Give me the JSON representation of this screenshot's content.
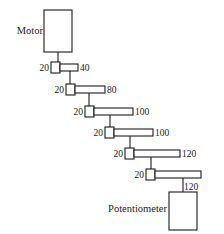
{
  "diagram": {
    "type": "gear-train-schematic",
    "stroke_color": "#1a1a1a",
    "fill_color": "#ffffff",
    "background_color": "#ffffff",
    "motor": {
      "label": "Motor",
      "label_x": 43,
      "label_y": 34,
      "box": {
        "x": 44,
        "y": 10,
        "w": 28,
        "h": 42
      }
    },
    "potentiometer": {
      "label": "Potentiometer",
      "label_x": 167,
      "label_y": 212,
      "box": {
        "x": 169,
        "y": 192,
        "w": 28,
        "h": 38
      }
    },
    "stages": [
      {
        "name": "stage-1",
        "pinion_teeth": "20",
        "gear_teeth": "40",
        "pinion": {
          "x": 51,
          "y": 62,
          "w": 9,
          "h": 11
        },
        "gear": {
          "x": 60,
          "y": 64,
          "w": 18,
          "h": 7
        },
        "pinion_label_x": 49,
        "pinion_label_y": 71,
        "gear_label_x": 80,
        "gear_label_y": 71
      },
      {
        "name": "stage-2",
        "pinion_teeth": "20",
        "gear_teeth": "80",
        "pinion": {
          "x": 66,
          "y": 84,
          "w": 9,
          "h": 11
        },
        "gear": {
          "x": 75,
          "y": 86,
          "w": 30,
          "h": 7
        },
        "pinion_label_x": 64,
        "pinion_label_y": 93,
        "gear_label_x": 107,
        "gear_label_y": 93
      },
      {
        "name": "stage-3",
        "pinion_teeth": "20",
        "gear_teeth": "100",
        "pinion": {
          "x": 85,
          "y": 106,
          "w": 9,
          "h": 11
        },
        "gear": {
          "x": 94,
          "y": 108,
          "w": 39,
          "h": 7
        },
        "pinion_label_x": 83,
        "pinion_label_y": 115,
        "gear_label_x": 135,
        "gear_label_y": 115
      },
      {
        "name": "stage-4",
        "pinion_teeth": "20",
        "gear_teeth": "100",
        "pinion": {
          "x": 105,
          "y": 127,
          "w": 9,
          "h": 11
        },
        "gear": {
          "x": 114,
          "y": 129,
          "w": 39,
          "h": 7
        },
        "pinion_label_x": 103,
        "pinion_label_y": 136,
        "gear_label_x": 155,
        "gear_label_y": 136
      },
      {
        "name": "stage-5",
        "pinion_teeth": "20",
        "gear_teeth": "120",
        "pinion": {
          "x": 125,
          "y": 148,
          "w": 9,
          "h": 11
        },
        "gear": {
          "x": 134,
          "y": 150,
          "w": 46,
          "h": 7
        },
        "pinion_label_x": 123,
        "pinion_label_y": 157,
        "gear_label_x": 182,
        "gear_label_y": 157
      },
      {
        "name": "stage-6",
        "pinion_teeth": "20",
        "gear_teeth": "120",
        "pinion": {
          "x": 146,
          "y": 169,
          "w": 9,
          "h": 11
        },
        "gear": {
          "x": 155,
          "y": 171,
          "w": 46,
          "h": 7
        },
        "pinion_label_x": 144,
        "pinion_label_y": 178,
        "gear_label_x": 184,
        "gear_label_y": 190
      }
    ],
    "shafts": [
      {
        "name": "shaft-motor-to-stage-1",
        "x1": 58,
        "y1": 52,
        "x2": 58,
        "y2": 62
      },
      {
        "name": "shaft-stage-1-to-stage-2",
        "x1": 70,
        "y1": 71,
        "x2": 70,
        "y2": 84
      },
      {
        "name": "shaft-stage-2-to-stage-3",
        "x1": 89,
        "y1": 93,
        "x2": 89,
        "y2": 106
      },
      {
        "name": "shaft-stage-3-to-stage-4",
        "x1": 110,
        "y1": 115,
        "x2": 110,
        "y2": 127
      },
      {
        "name": "shaft-stage-4-to-stage-5",
        "x1": 130,
        "y1": 136,
        "x2": 130,
        "y2": 148
      },
      {
        "name": "shaft-stage-5-to-stage-6",
        "x1": 151,
        "y1": 157,
        "x2": 151,
        "y2": 169
      },
      {
        "name": "shaft-stage-6-to-potentiometer",
        "x1": 183,
        "y1": 178,
        "x2": 183,
        "y2": 192
      }
    ]
  }
}
